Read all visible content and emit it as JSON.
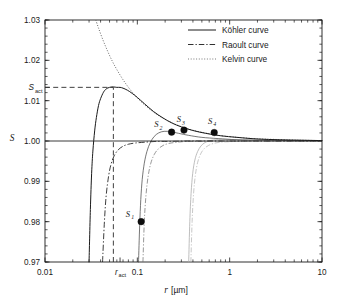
{
  "chart_data": {
    "type": "line",
    "title": "",
    "xlabel": "r [µm]",
    "ylabel": "S",
    "xscale": "log",
    "yscale": "linear",
    "xlim": [
      0.01,
      10
    ],
    "ylim": [
      0.97,
      1.03
    ],
    "grid": false,
    "legend_position": "top-right",
    "x_tick_labels": [
      "0.01",
      "0.1",
      "1",
      "10"
    ],
    "x_tick_values": [
      0.01,
      0.1,
      1,
      10
    ],
    "x_special_tick": {
      "label": "r",
      "subscript": "act",
      "value": 0.065
    },
    "y_tick_labels": [
      "0.97",
      "0.98",
      "0.99",
      "1.00",
      "1.01",
      "1.02",
      "1.03"
    ],
    "y_tick_values": [
      0.97,
      0.98,
      0.99,
      1.0,
      1.01,
      1.02,
      1.03
    ],
    "y_special_tick": {
      "label": "S",
      "subscript": "act",
      "value": 1.0133
    },
    "series": [
      {
        "name": "Köhler curve",
        "style": "solid",
        "color": "#1a1a1a",
        "points": [
          [
            0.03,
            0.97
          ],
          [
            0.031,
            0.983
          ],
          [
            0.032,
            0.992
          ],
          [
            0.033,
            0.9975
          ],
          [
            0.0345,
            1.0025
          ],
          [
            0.036,
            1.0058
          ],
          [
            0.038,
            1.0088
          ],
          [
            0.04,
            1.0105
          ],
          [
            0.043,
            1.0121
          ],
          [
            0.046,
            1.0129
          ],
          [
            0.05,
            1.0133
          ],
          [
            0.055,
            1.0134
          ],
          [
            0.06,
            1.0133
          ],
          [
            0.065,
            1.0133
          ],
          [
            0.07,
            1.0131
          ],
          [
            0.078,
            1.0126
          ],
          [
            0.088,
            1.0118
          ],
          [
            0.1,
            1.0108
          ],
          [
            0.12,
            1.0092
          ],
          [
            0.15,
            1.0073
          ],
          [
            0.19,
            1.0057
          ],
          [
            0.24,
            1.0044
          ],
          [
            0.3,
            1.0035
          ],
          [
            0.4,
            1.0026
          ],
          [
            0.55,
            1.0019
          ],
          [
            0.8,
            1.0013
          ],
          [
            1.2,
            1.0009
          ],
          [
            2.0,
            1.0005
          ],
          [
            3.5,
            1.0003
          ],
          [
            6.0,
            1.0002
          ],
          [
            10.0,
            1.0001
          ]
        ]
      },
      {
        "name": "Raoult curve",
        "style": "dashdot",
        "color": "#1a1a1a",
        "points": [
          [
            0.042,
            0.97
          ],
          [
            0.044,
            0.98
          ],
          [
            0.046,
            0.9865
          ],
          [
            0.049,
            0.9915
          ],
          [
            0.052,
            0.9943
          ],
          [
            0.056,
            0.9963
          ],
          [
            0.062,
            0.9978
          ],
          [
            0.07,
            0.9987
          ],
          [
            0.08,
            0.9992
          ],
          [
            0.095,
            0.9995
          ],
          [
            0.12,
            0.9997
          ],
          [
            0.16,
            0.9999
          ],
          [
            0.22,
            0.9999
          ],
          [
            0.35,
            1.0
          ],
          [
            0.6,
            1.0
          ],
          [
            1.2,
            1.0
          ],
          [
            3.0,
            1.0
          ],
          [
            10.0,
            1.0
          ]
        ]
      },
      {
        "name": "Kelvin curve",
        "style": "dotted",
        "color": "#555555",
        "points": [
          [
            0.0355,
            1.03
          ],
          [
            0.038,
            1.028
          ],
          [
            0.042,
            1.0253
          ],
          [
            0.047,
            1.0226
          ],
          [
            0.053,
            1.02
          ],
          [
            0.06,
            1.0177
          ],
          [
            0.07,
            1.0152
          ],
          [
            0.082,
            1.013
          ],
          [
            0.1,
            1.0107
          ],
          [
            0.125,
            1.0086
          ],
          [
            0.16,
            1.0067
          ],
          [
            0.21,
            1.0051
          ],
          [
            0.28,
            1.0038
          ],
          [
            0.38,
            1.0028
          ],
          [
            0.52,
            1.0021
          ],
          [
            0.75,
            1.0014
          ],
          [
            1.1,
            1.001
          ],
          [
            1.8,
            1.0006
          ],
          [
            3.0,
            1.0004
          ],
          [
            5.5,
            1.0002
          ],
          [
            10.0,
            1.0001
          ]
        ]
      }
    ],
    "secondary_kohler_curves": [
      {
        "name": "kohler-2",
        "shade": "mid",
        "points": [
          [
            0.103,
            0.97
          ],
          [
            0.106,
            0.979
          ],
          [
            0.109,
            0.9855
          ],
          [
            0.113,
            0.9905
          ],
          [
            0.119,
            0.9945
          ],
          [
            0.127,
            0.9974
          ],
          [
            0.138,
            0.9996
          ],
          [
            0.152,
            1.0011
          ],
          [
            0.17,
            1.002
          ],
          [
            0.195,
            1.0024
          ],
          [
            0.23,
            1.0023
          ],
          [
            0.28,
            1.0019
          ],
          [
            0.36,
            1.0014
          ],
          [
            0.5,
            1.0009
          ],
          [
            0.75,
            1.0006
          ],
          [
            1.2,
            1.0003
          ],
          [
            2.2,
            1.0002
          ],
          [
            5.0,
            1.0001
          ],
          [
            10.0,
            1.0001
          ]
        ]
      },
      {
        "name": "kohler-3",
        "shade": "faint",
        "points": [
          [
            0.36,
            0.97
          ],
          [
            0.37,
            0.98
          ],
          [
            0.382,
            0.987
          ],
          [
            0.398,
            0.992
          ],
          [
            0.42,
            0.9953
          ],
          [
            0.45,
            0.9974
          ],
          [
            0.49,
            0.9988
          ],
          [
            0.54,
            0.9996
          ],
          [
            0.61,
            1.0001
          ],
          [
            0.7,
            1.0003
          ],
          [
            0.82,
            1.0004
          ],
          [
            1.0,
            1.0004
          ],
          [
            1.3,
            1.0003
          ],
          [
            1.8,
            1.0002
          ],
          [
            2.8,
            1.0002
          ],
          [
            5.0,
            1.0001
          ],
          [
            10.0,
            1.0001
          ]
        ]
      }
    ],
    "secondary_raoult_curves": [
      {
        "name": "raoult-2",
        "shade": "mid",
        "points": [
          [
            0.115,
            0.97
          ],
          [
            0.119,
            0.98
          ],
          [
            0.124,
            0.9865
          ],
          [
            0.131,
            0.9913
          ],
          [
            0.14,
            0.9945
          ],
          [
            0.152,
            0.9966
          ],
          [
            0.168,
            0.998
          ],
          [
            0.19,
            0.9989
          ],
          [
            0.22,
            0.9994
          ],
          [
            0.27,
            0.9997
          ],
          [
            0.34,
            0.9999
          ],
          [
            0.45,
            0.9999
          ],
          [
            0.65,
            1.0
          ],
          [
            1.0,
            1.0
          ],
          [
            2.0,
            1.0
          ],
          [
            10.0,
            1.0
          ]
        ]
      },
      {
        "name": "raoult-3",
        "shade": "faint",
        "points": [
          [
            0.38,
            0.97
          ],
          [
            0.392,
            0.98
          ],
          [
            0.406,
            0.9868
          ],
          [
            0.425,
            0.9915
          ],
          [
            0.45,
            0.9947
          ],
          [
            0.485,
            0.9968
          ],
          [
            0.53,
            0.9981
          ],
          [
            0.59,
            0.9989
          ],
          [
            0.67,
            0.9994
          ],
          [
            0.78,
            0.9997
          ],
          [
            0.93,
            0.9998
          ],
          [
            1.15,
            0.9999
          ],
          [
            1.5,
            1.0
          ],
          [
            2.2,
            1.0
          ],
          [
            4.0,
            1.0
          ],
          [
            10.0,
            1.0
          ]
        ]
      }
    ],
    "markers": [
      {
        "label": "S",
        "subscript": "1",
        "x": 0.11,
        "y": 0.98,
        "label_dx": -11,
        "label_dy": -5
      },
      {
        "label": "S",
        "subscript": "2",
        "x": 0.235,
        "y": 1.0022,
        "label_dx": -13,
        "label_dy": -5
      },
      {
        "label": "S",
        "subscript": "3",
        "x": 0.32,
        "y": 1.0027,
        "label_dx": -3,
        "label_dy": -8
      },
      {
        "label": "S",
        "subscript": "4",
        "x": 0.68,
        "y": 1.0021,
        "label_dx": -2,
        "label_dy": -9
      }
    ],
    "guides": [
      {
        "name": "s-act-horizontal",
        "type": "horizontal",
        "y": 1.0133,
        "x_from": 0.01,
        "x_to": 0.055
      },
      {
        "name": "r-act-vertical",
        "type": "vertical",
        "x": 0.055,
        "y_from": 0.97,
        "y_to": 1.0133
      }
    ],
    "saturation_line": {
      "name": "saturation-baseline",
      "y": 1.0,
      "x_from": 0.01,
      "x_to": 10
    }
  },
  "legend": {
    "items": [
      {
        "label": "Köhler curve",
        "style": "solid"
      },
      {
        "label": "Raoult curve",
        "style": "dashdot"
      },
      {
        "label": "Kelvin curve",
        "style": "dotted"
      }
    ]
  },
  "axes": {
    "x_title_symbol": "r",
    "x_title_unit": "[µm]",
    "y_title_symbol": "S"
  }
}
